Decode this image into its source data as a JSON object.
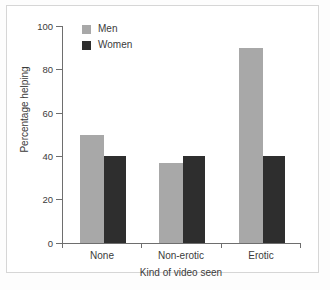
{
  "chart_data": {
    "type": "bar",
    "title": "",
    "xlabel": "Kind of video seen",
    "ylabel": "Percentage helping",
    "categories": [
      "None",
      "Non-erotic",
      "Erotic"
    ],
    "series": [
      {
        "name": "Men",
        "color": "#a8a8a8",
        "values": [
          50,
          37,
          90
        ]
      },
      {
        "name": "Women",
        "color": "#2e2e2e",
        "values": [
          40,
          40,
          40
        ]
      }
    ],
    "ylim": [
      0,
      100
    ],
    "yticks": [
      0,
      20,
      40,
      60,
      80,
      100
    ],
    "ytick_labels": [
      "0",
      "20",
      "40",
      "60",
      "80",
      "100"
    ],
    "grid": false,
    "legend_position": "top-left-inside",
    "legend_entries": [
      "Men",
      "Women"
    ]
  },
  "axes": {
    "y_label": "Percentage helping",
    "x_label": "Kind of video seen"
  },
  "legend": {
    "items": [
      {
        "label": "Men"
      },
      {
        "label": "Women"
      }
    ]
  }
}
